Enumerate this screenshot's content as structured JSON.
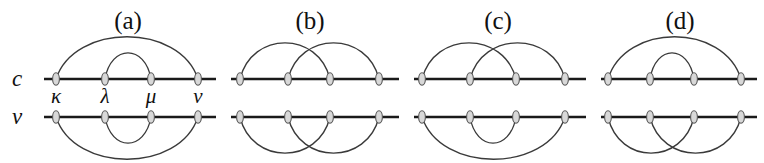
{
  "figure": {
    "background_color": "#ffffff",
    "line_color": "#1a1a1a",
    "arc_color": "#3a3a3a",
    "vertex_fill": "#d8d8d8",
    "width": 764,
    "height": 163
  },
  "axis_labels": {
    "upper": "c",
    "lower": "v"
  },
  "vertex_labels": [
    "κ",
    "λ",
    "μ",
    "ν"
  ],
  "panels": [
    {
      "label": "(a)",
      "label_x": 128,
      "line_x1": 44,
      "line_x2": 216,
      "vertices": [
        56,
        105,
        151,
        198
      ],
      "show_vertex_labels": true,
      "upper_pairing": "nested",
      "lower_pairing": "nested",
      "upper_arcs": [
        {
          "from": 0,
          "to": 3,
          "height": 42
        },
        {
          "from": 1,
          "to": 2,
          "height": 26
        }
      ],
      "lower_arcs": [
        {
          "from": 0,
          "to": 3,
          "height": 42
        },
        {
          "from": 1,
          "to": 2,
          "height": 26
        }
      ]
    },
    {
      "label": "(b)",
      "label_x": 310,
      "line_x1": 231,
      "line_x2": 399,
      "vertices": [
        240,
        288,
        330,
        379
      ],
      "show_vertex_labels": false,
      "upper_pairing": "crossing",
      "lower_pairing": "crossing",
      "upper_arcs": [
        {
          "from": 0,
          "to": 2,
          "height": 36
        },
        {
          "from": 1,
          "to": 3,
          "height": 36
        }
      ],
      "lower_arcs": [
        {
          "from": 0,
          "to": 2,
          "height": 36
        },
        {
          "from": 1,
          "to": 3,
          "height": 36
        }
      ]
    },
    {
      "label": "(c)",
      "label_x": 498,
      "line_x1": 414,
      "line_x2": 586,
      "vertices": [
        422,
        470,
        516,
        565
      ],
      "show_vertex_labels": false,
      "upper_pairing": "crossing",
      "lower_pairing": "nested",
      "upper_arcs": [
        {
          "from": 0,
          "to": 2,
          "height": 36
        },
        {
          "from": 1,
          "to": 3,
          "height": 36
        }
      ],
      "lower_arcs": [
        {
          "from": 0,
          "to": 3,
          "height": 42
        },
        {
          "from": 1,
          "to": 2,
          "height": 26
        }
      ]
    },
    {
      "label": "(d)",
      "label_x": 680,
      "line_x1": 601,
      "line_x2": 757,
      "vertices": [
        608,
        650,
        694,
        741
      ],
      "show_vertex_labels": false,
      "upper_pairing": "nested",
      "lower_pairing": "crossing",
      "upper_arcs": [
        {
          "from": 0,
          "to": 3,
          "height": 42
        },
        {
          "from": 1,
          "to": 2,
          "height": 26
        }
      ],
      "lower_arcs": [
        {
          "from": 0,
          "to": 2,
          "height": 36
        },
        {
          "from": 1,
          "to": 3,
          "height": 36
        }
      ]
    }
  ],
  "geometry": {
    "upper_line_y": 79,
    "lower_line_y": 117,
    "panel_label_y": 8,
    "vertex_label_y": 86,
    "axis_label_upper_y": 67,
    "axis_label_lower_y": 105,
    "axis_label_x": 12
  }
}
